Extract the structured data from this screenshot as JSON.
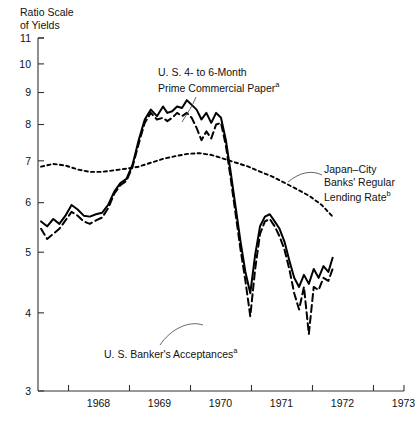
{
  "axis_caption": "Ratio Scale\nof Yields",
  "annotations": {
    "commercial_paper": {
      "line1": "U. S. 4- to 6-Month",
      "line2": "Prime Commercial Paper",
      "sup": "a"
    },
    "japan": {
      "line1": "Japan–City",
      "line2": "Banks' Regular",
      "line3": "Lending Rate",
      "sup": "b"
    },
    "acceptances": {
      "line1": "U. S. Banker's Acceptances",
      "sup": "a"
    }
  },
  "chart_data": {
    "type": "line",
    "title": "",
    "xlabel": "",
    "ylabel": "Ratio Scale of Yields",
    "scale": "log",
    "grid": false,
    "legend": "annotations",
    "ylim": [
      3,
      11
    ],
    "yticks": [
      3,
      4,
      5,
      6,
      7,
      8,
      9,
      10,
      11
    ],
    "ytick_labels": [
      "3",
      "4",
      "5",
      "6",
      "7",
      "8",
      "9",
      "10",
      "11"
    ],
    "xlim": [
      1967.5,
      1973.5
    ],
    "xticks": [
      1968,
      1969,
      1970,
      1971,
      1972,
      1973
    ],
    "xtick_labels": [
      "1968",
      "1969",
      "1970",
      "1971",
      "1972",
      "1973"
    ],
    "series": [
      {
        "name": "U. S. 4- to 6-Month Prime Commercial Paper",
        "style": "solid",
        "color": "#000000",
        "x": [
          1967.55,
          1967.65,
          1967.75,
          1967.85,
          1967.95,
          1968.05,
          1968.15,
          1968.25,
          1968.35,
          1968.45,
          1968.55,
          1968.65,
          1968.75,
          1968.85,
          1968.95,
          1969.05,
          1969.15,
          1969.25,
          1969.35,
          1969.45,
          1969.55,
          1969.62,
          1969.7,
          1969.78,
          1969.86,
          1969.94,
          1970.02,
          1970.1,
          1970.18,
          1970.26,
          1970.34,
          1970.42,
          1970.5,
          1970.58,
          1970.66,
          1970.74,
          1970.82,
          1970.9,
          1970.98,
          1971.06,
          1971.14,
          1971.22,
          1971.3,
          1971.38,
          1971.46,
          1971.54,
          1971.62,
          1971.7,
          1971.78,
          1971.86,
          1971.94,
          1972.02,
          1972.1,
          1972.18,
          1972.26,
          1972.33
        ],
        "y": [
          5.6,
          5.5,
          5.65,
          5.55,
          5.72,
          5.95,
          5.85,
          5.72,
          5.7,
          5.75,
          5.78,
          5.95,
          6.25,
          6.45,
          6.55,
          6.9,
          7.55,
          8.15,
          8.45,
          8.25,
          8.55,
          8.35,
          8.4,
          8.55,
          8.5,
          8.75,
          8.6,
          8.45,
          8.15,
          8.35,
          8.05,
          8.35,
          8.2,
          7.55,
          6.7,
          5.9,
          5.2,
          4.65,
          4.3,
          4.95,
          5.5,
          5.7,
          5.75,
          5.6,
          5.45,
          5.2,
          4.85,
          4.55,
          4.4,
          4.6,
          4.45,
          4.7,
          4.55,
          4.75,
          4.65,
          4.9
        ]
      },
      {
        "name": "U. S. Banker's Acceptances",
        "style": "dashed",
        "color": "#000000",
        "x": [
          1967.55,
          1967.65,
          1967.75,
          1967.85,
          1967.95,
          1968.05,
          1968.15,
          1968.25,
          1968.35,
          1968.45,
          1968.55,
          1968.65,
          1968.75,
          1968.85,
          1968.95,
          1969.05,
          1969.15,
          1969.25,
          1969.35,
          1969.45,
          1969.55,
          1969.62,
          1969.7,
          1969.78,
          1969.86,
          1969.94,
          1970.02,
          1970.1,
          1970.18,
          1970.26,
          1970.34,
          1970.42,
          1970.5,
          1970.58,
          1970.66,
          1970.74,
          1970.82,
          1970.9,
          1970.98,
          1971.06,
          1971.14,
          1971.22,
          1971.3,
          1971.38,
          1971.46,
          1971.54,
          1971.62,
          1971.7,
          1971.78,
          1971.86,
          1971.94,
          1972.02,
          1972.1,
          1972.18,
          1972.26,
          1972.33
        ],
        "y": [
          5.45,
          5.25,
          5.35,
          5.45,
          5.62,
          5.8,
          5.72,
          5.6,
          5.55,
          5.62,
          5.68,
          5.88,
          6.2,
          6.4,
          6.5,
          6.85,
          7.45,
          8.05,
          8.35,
          8.15,
          8.2,
          8.1,
          8.2,
          8.35,
          8.25,
          8.35,
          8.2,
          7.9,
          7.55,
          7.8,
          7.6,
          8.0,
          8.05,
          7.4,
          6.55,
          5.75,
          5.05,
          4.5,
          3.95,
          4.7,
          5.35,
          5.6,
          5.65,
          5.5,
          5.3,
          5.05,
          4.7,
          4.3,
          4.05,
          4.4,
          3.7,
          4.4,
          4.35,
          4.55,
          4.5,
          4.7
        ]
      },
      {
        "name": "Japan–City Banks' Regular Lending Rate",
        "style": "dotted",
        "color": "#000000",
        "x": [
          1967.55,
          1967.75,
          1967.95,
          1968.15,
          1968.35,
          1968.55,
          1968.75,
          1968.95,
          1969.15,
          1969.35,
          1969.55,
          1969.75,
          1969.95,
          1970.15,
          1970.35,
          1970.55,
          1970.75,
          1970.95,
          1971.15,
          1971.35,
          1971.55,
          1971.75,
          1971.95,
          1972.15,
          1972.33
        ],
        "y": [
          6.85,
          6.92,
          6.88,
          6.78,
          6.72,
          6.72,
          6.76,
          6.8,
          6.85,
          6.95,
          7.05,
          7.12,
          7.18,
          7.2,
          7.15,
          7.05,
          6.95,
          6.85,
          6.72,
          6.6,
          6.45,
          6.3,
          6.15,
          5.95,
          5.7
        ]
      }
    ]
  }
}
